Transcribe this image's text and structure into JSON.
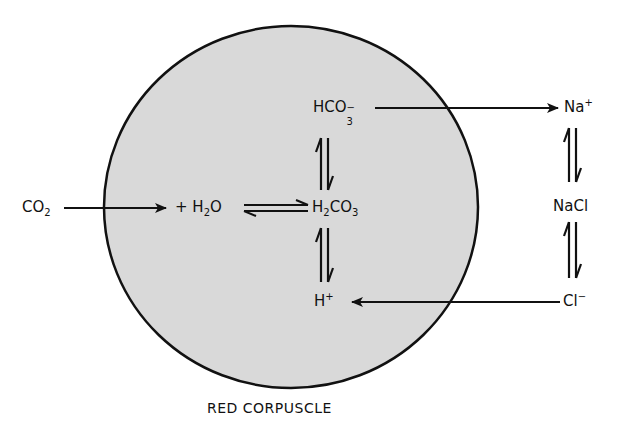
{
  "diagram": {
    "title": "RED CORPUSCLE",
    "colors": {
      "cell_fill": "#d9d9d9",
      "stroke": "#111111",
      "background": "#ffffff"
    },
    "cell": {
      "label": "RED CORPUSCLE",
      "shape": "ellipse"
    },
    "species": {
      "co2": {
        "main": "CO",
        "sub": "2"
      },
      "h2o": {
        "prefix": "+ ",
        "main1": "H",
        "sub": "2",
        "main2": "O"
      },
      "h2co3": {
        "main1": "H",
        "sub": "2",
        "main2": "CO",
        "sub2": "3"
      },
      "hco3": {
        "main": "HCO",
        "sub": "3",
        "sup": "−"
      },
      "hplus": {
        "main": "H",
        "sup": "+"
      },
      "naplus": {
        "main": "Na",
        "sup": "+"
      },
      "nacl": {
        "main": "NaCl"
      },
      "clminus": {
        "main": "Cl",
        "sup": "−"
      }
    },
    "connections": [
      {
        "from": "CO2",
        "to": "H2O",
        "type": "arrow"
      },
      {
        "from": "H2O",
        "to": "H2CO3",
        "type": "equilibrium"
      },
      {
        "from": "H2CO3",
        "to": "HCO3-",
        "type": "equilibrium"
      },
      {
        "from": "H2CO3",
        "to": "H+",
        "type": "equilibrium"
      },
      {
        "from": "HCO3-",
        "to": "Na+",
        "type": "arrow"
      },
      {
        "from": "Na+",
        "to": "NaCl",
        "type": "equilibrium"
      },
      {
        "from": "NaCl",
        "to": "Cl-",
        "type": "equilibrium"
      },
      {
        "from": "Cl-",
        "to": "H+",
        "type": "arrow"
      }
    ]
  }
}
